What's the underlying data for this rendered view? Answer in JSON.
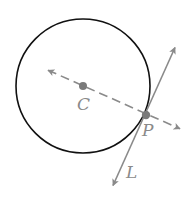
{
  "diagram": {
    "colors": {
      "circle": "#111111",
      "lines": "#8a8a8a",
      "points": "#7a7a7a",
      "labels": "#8a8a8a",
      "background": "#ffffff"
    },
    "circle": {
      "cx": 83,
      "cy": 86,
      "r": 67
    },
    "points": [
      {
        "id": "C",
        "label": "C",
        "x": 83,
        "y": 86,
        "label_x": 77,
        "label_y": 110
      },
      {
        "id": "P",
        "label": "P",
        "x": 146,
        "y": 115,
        "label_x": 142,
        "label_y": 136
      }
    ],
    "lines": [
      {
        "id": "radius-line",
        "style": "dashed",
        "from": {
          "x": 43,
          "y": 68
        },
        "to": {
          "x": 185,
          "y": 131
        },
        "arrows": "both"
      },
      {
        "id": "tangent-line",
        "label": "L",
        "style": "solid",
        "from": {
          "x": 177,
          "y": 43
        },
        "to": {
          "x": 111,
          "y": 190
        },
        "arrows": "both",
        "label_x": 126,
        "label_y": 178
      }
    ]
  }
}
